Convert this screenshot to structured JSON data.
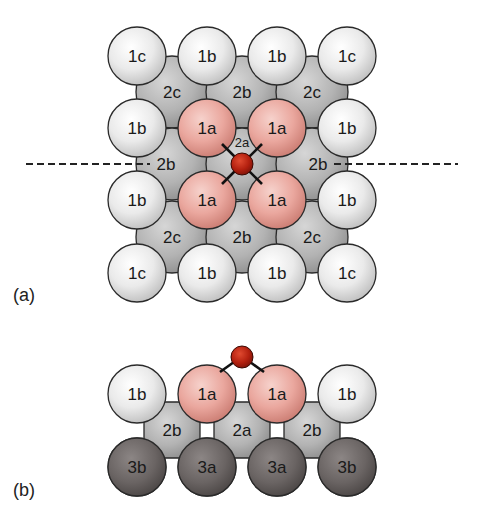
{
  "figure": {
    "colors": {
      "layer1_light": "#eeeeee",
      "layer1_highlight": "#e8a59c",
      "layer2": "#b5b5b5",
      "layer3": "#6b6564",
      "oxygen": "#b3200f",
      "dashed_line": "#222222",
      "bond": "#111111"
    },
    "panel_a": {
      "label": "(a)",
      "view": "top view",
      "layer1_rows": [
        [
          "1c",
          "1b",
          "1b",
          "1c"
        ],
        [
          "1b",
          "1a",
          "1a",
          "1b"
        ],
        [
          "1b",
          "1a",
          "1a",
          "1b"
        ],
        [
          "1c",
          "1b",
          "1b",
          "1c"
        ]
      ],
      "layer2_rows": [
        [
          "2c",
          "2b",
          "2c"
        ],
        [
          "2b",
          "2a",
          "2b"
        ],
        [
          "2c",
          "2b",
          "2c"
        ]
      ],
      "adsorbate": "O",
      "adsorbate_site_label": "2a",
      "bonds": 4,
      "dashed_cut_line": true
    },
    "panel_b": {
      "label": "(b)",
      "view": "side view (cross-section along dashed line)",
      "layer1": [
        "1b",
        "1a",
        "1a",
        "1b"
      ],
      "layer2": [
        "2b",
        "2a",
        "2b"
      ],
      "layer3": [
        "3b",
        "3a",
        "3a",
        "3b"
      ],
      "adsorbate": "O",
      "bonds": 2
    }
  }
}
